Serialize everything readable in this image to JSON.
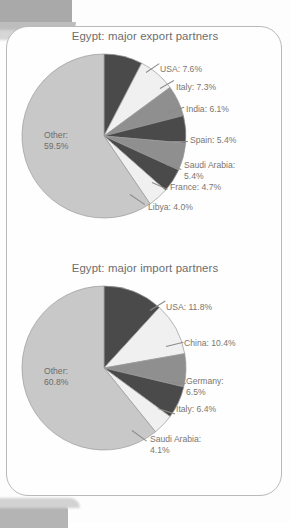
{
  "page": {
    "background_color": "#fdfdfd",
    "frame_border_color": "#b9b9b9",
    "edge_artifact_color": "#a9a9a9"
  },
  "palette": {
    "dark": "#4a4a4a",
    "light": "#f0f0f0",
    "medium": "#8f8f8f",
    "other": "#c8c8c8",
    "outline": "#9a9a9a",
    "text": "#7a7672",
    "title_text": "#6d6d6d"
  },
  "chart_data": [
    {
      "type": "pie",
      "id": "export",
      "title": "Egypt: major export partners",
      "xlabel": "",
      "ylabel": "",
      "legend_position": "callout-labels",
      "categories": [
        "USA",
        "Italy",
        "India",
        "Spain",
        "Saudi Arabia",
        "France",
        "Libya",
        "Other"
      ],
      "values": [
        7.6,
        7.3,
        6.1,
        5.4,
        5.4,
        4.7,
        4.0,
        59.5
      ],
      "labels": [
        "USA: 7.6%",
        "Italy: 7.3%",
        "India: 6.1%",
        "Spain: 5.4%",
        "Saudi Arabia: 5.4%",
        "France: 4.7%",
        "Libya: 4.0%",
        "Other: 59.5%"
      ],
      "other_label_line1": "Other:",
      "other_label_line2": "59.5%",
      "colors": [
        "#4a4a4a",
        "#f0f0f0",
        "#8f8f8f",
        "#4a4a4a",
        "#8f8f8f",
        "#4a4a4a",
        "#f0f0f0",
        "#c8c8c8"
      ]
    },
    {
      "type": "pie",
      "id": "import",
      "title": "Egypt: major import partners",
      "xlabel": "",
      "ylabel": "",
      "legend_position": "callout-labels",
      "categories": [
        "USA",
        "China",
        "Germany",
        "Italy",
        "Saudi Arabia",
        "Other"
      ],
      "values": [
        11.8,
        10.4,
        6.5,
        6.4,
        4.1,
        60.8
      ],
      "labels": [
        "USA: 11.8%",
        "China: 10.4%",
        "Germany: 6.5%",
        "Italy: 6.4%",
        "Saudi Arabia: 4.1%",
        "Other: 60.8%"
      ],
      "other_label_line1": "Other:",
      "other_label_line2": "60.8%",
      "colors": [
        "#4a4a4a",
        "#f0f0f0",
        "#8f8f8f",
        "#4a4a4a",
        "#f0f0f0",
        "#c8c8c8"
      ]
    }
  ],
  "export_chart": {
    "title": "Egypt: major export partners",
    "callouts": {
      "usa": "USA: 7.6%",
      "italy": "Italy: 7.3%",
      "india": "India: 6.1%",
      "spain": "Spain: 5.4%",
      "saudi_line1": "Saudi Arabia:",
      "saudi_line2": "5.4%",
      "france": "France: 4.7%",
      "libya": "Libya: 4.0%",
      "other_line1": "Other:",
      "other_line2": "59.5%"
    }
  },
  "import_chart": {
    "title": "Egypt: major import partners",
    "callouts": {
      "usa": "USA: 11.8%",
      "china": "China: 10.4%",
      "germany_line1": "Germany:",
      "germany_line2": "6.5%",
      "italy": "Italy: 6.4%",
      "saudi_line1": "Saudi Arabia:",
      "saudi_line2": "4.1%",
      "other_line1": "Other:",
      "other_line2": "60.8%"
    }
  }
}
